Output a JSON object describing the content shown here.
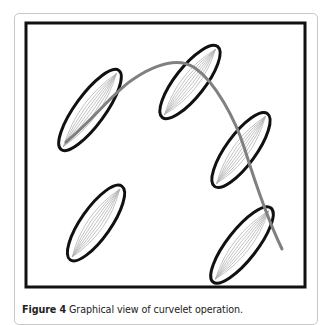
{
  "figure": {
    "label": "Figure 4",
    "caption": "Graphical view of curvelet operation.",
    "colors": {
      "frame": "#111111",
      "ellipse_stroke": "#111111",
      "curve": "#808080",
      "hatch": "#b0b0b0",
      "card_border": "#c8c8c8"
    },
    "frame": {
      "x": 25,
      "y": 22,
      "width": 280,
      "height": 264
    },
    "ellipses": [
      {
        "cx": 90,
        "cy": 110,
        "rx": 15,
        "ry": 49,
        "rotate": 36
      },
      {
        "cx": 190,
        "cy": 82,
        "rx": 15,
        "ry": 45,
        "rotate": 38
      },
      {
        "cx": 241,
        "cy": 150,
        "rx": 15,
        "ry": 45,
        "rotate": 36
      },
      {
        "cx": 96,
        "cy": 223,
        "rx": 15,
        "ry": 45,
        "rotate": 35
      },
      {
        "cx": 242,
        "cy": 245,
        "rx": 15,
        "ry": 47,
        "rotate": 38
      }
    ],
    "curve_path": "M66,142 C95,118 115,90 135,78 C160,62 180,58 195,68 C215,82 235,118 245,150 C255,182 268,220 282,249"
  }
}
